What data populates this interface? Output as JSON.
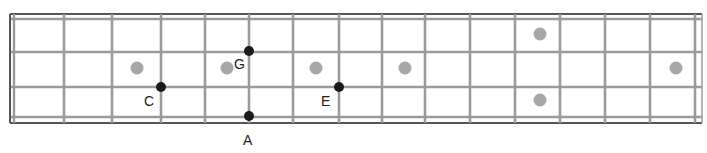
{
  "diagram": {
    "type": "bass-fretboard",
    "strings_count": 4,
    "frets_count": 15,
    "colors": {
      "border": "#555555",
      "string": "#999999",
      "fret": "#999999",
      "inlay": "#a6a6a6",
      "note": "#1a1a1a",
      "label": "#222222"
    },
    "inlay_markers": [
      {
        "fret": 3,
        "position": "center"
      },
      {
        "fret": 5,
        "position": "center"
      },
      {
        "fret": 7,
        "position": "center"
      },
      {
        "fret": 9,
        "position": "center"
      },
      {
        "fret": 12,
        "position": "double"
      },
      {
        "fret": 15,
        "position": "center"
      }
    ],
    "notes": [
      {
        "label": "C",
        "string": 3,
        "fret_line": 3
      },
      {
        "label": "G",
        "string": 2,
        "fret_line": 5
      },
      {
        "label": "A",
        "string": 4,
        "fret_line": 5
      },
      {
        "label": "E",
        "string": 3,
        "fret_line": 7
      }
    ]
  }
}
